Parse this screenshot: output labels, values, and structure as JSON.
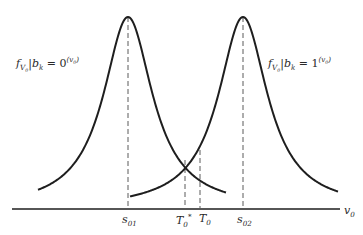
{
  "figure": {
    "colors": {
      "line": "#1e1e1e",
      "dash": "#5a5a5a",
      "background": "#ffffff"
    },
    "axis": {
      "label_main": "v",
      "label_sub": "0"
    },
    "curves": [
      {
        "name": "left",
        "center_label_main": "s",
        "center_label_sub": "01",
        "label": {
          "f": "f",
          "f_sub": "V",
          "f_sub2": "0",
          "cond": "|b",
          "cond_sub": "k",
          "eq": " = 0",
          "sup": "(v",
          "sup_sub": "0",
          "sup_end": ")"
        }
      },
      {
        "name": "right",
        "center_label_main": "s",
        "center_label_sub": "02",
        "label": {
          "f": "f",
          "f_sub": "V",
          "f_sub2": "0",
          "cond": "|b",
          "cond_sub": "k",
          "eq": " = 1",
          "sup": "(v",
          "sup_sub": "0",
          "sup_end": ")"
        }
      }
    ],
    "thresholds": [
      {
        "name": "T0-star",
        "main": "T",
        "sub": "0",
        "sup": "*"
      },
      {
        "name": "T0",
        "main": "T",
        "sub": "0"
      }
    ]
  }
}
